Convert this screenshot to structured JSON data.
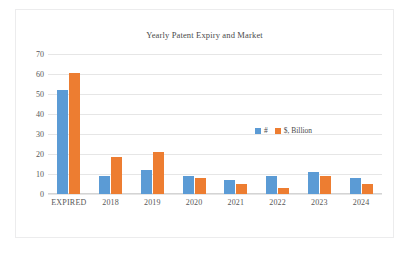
{
  "chart_data": {
    "type": "bar",
    "title": "Yearly Patent Expiry and Market",
    "xlabel": "",
    "ylabel": "",
    "categories": [
      "EXPIRED",
      "2018",
      "2019",
      "2020",
      "2021",
      "2022",
      "2023",
      "2024"
    ],
    "series": [
      {
        "name": "#",
        "color": "#5b9bd5",
        "values": [
          52,
          9,
          12,
          9,
          7,
          9,
          11,
          8
        ]
      },
      {
        "name": "$, Billion",
        "color": "#ed7d31",
        "values": [
          60.5,
          18.5,
          21,
          8,
          5,
          3,
          9,
          5
        ]
      }
    ],
    "ylim": [
      0,
      70
    ],
    "ytick_step": 10,
    "yticks": [
      "70",
      "60",
      "50",
      "40",
      "30",
      "20",
      "10",
      "0"
    ],
    "grid": true,
    "legend_position": "inside-right",
    "gridline_color": "#e6e6e6",
    "text_color": "#575757",
    "title_color": "#4a4a4a",
    "background": "#ffffff",
    "border_color": "#ececed"
  }
}
